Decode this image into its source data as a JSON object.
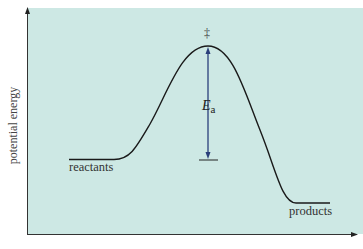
{
  "diagram": {
    "y_axis_label": "potential energy",
    "x_axis_label": "",
    "labels": {
      "reactants": "reactants",
      "products": "products",
      "transition_state": "‡",
      "activation_energy_symbol": "E",
      "activation_energy_subscript": "a"
    },
    "colors": {
      "background": "#cde8e4",
      "curve": "#1a1a1a",
      "ea_arrow": "#2a3f7a",
      "axes": "#333333"
    },
    "levels": {
      "reactants_y": 159,
      "transition_state_y": 46,
      "products_y": 203
    }
  }
}
